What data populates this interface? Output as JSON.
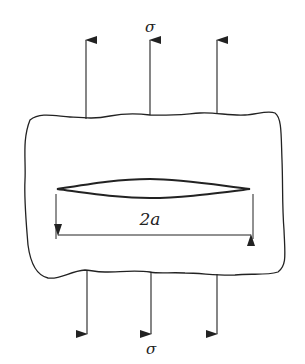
{
  "diagram": {
    "labels": {
      "stress_top": "σ",
      "stress_bottom": "σ",
      "crack_length": "2a"
    },
    "colors": {
      "line": "#222222",
      "background": "#ffffff"
    },
    "arrows": {
      "top_count": 3,
      "bottom_count": 3,
      "direction_top": "up",
      "direction_bottom": "down"
    }
  }
}
